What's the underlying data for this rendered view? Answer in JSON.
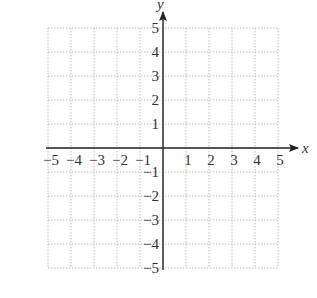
{
  "chart_data": {
    "type": "scatter",
    "title": "",
    "xlabel": "x",
    "ylabel": "y",
    "xlim": [
      -5,
      5
    ],
    "ylim": [
      -5,
      5
    ],
    "grid": true,
    "grid_style": "dotted",
    "x_ticks": [
      -5,
      -4,
      -3,
      -2,
      -1,
      1,
      2,
      3,
      4,
      5
    ],
    "y_ticks": [
      -5,
      -4,
      -3,
      -2,
      -1,
      1,
      2,
      3,
      4,
      5
    ],
    "x_tick_labels": [
      "−5",
      "−4",
      "−3",
      "−2",
      "−1",
      "1",
      "2",
      "3",
      "4",
      "5"
    ],
    "y_tick_labels": [
      "−5",
      "−4",
      "−3",
      "−2",
      "−1",
      "1",
      "2",
      "3",
      "4",
      "5"
    ],
    "series": []
  },
  "colors": {
    "axis": "#222222",
    "grid": "#bdbdbd",
    "text": "#333333"
  },
  "layout": {
    "origin_x": 163,
    "origin_y": 148,
    "unit_x": 23,
    "unit_y": 24
  }
}
